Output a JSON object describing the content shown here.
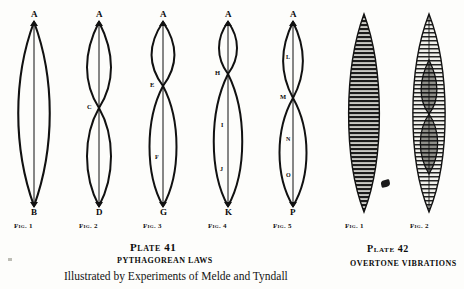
{
  "plate41": {
    "title": "Plate 41",
    "subtitle": "PYTHAGOREAN LAWS",
    "credit": "Illustrated by Experiments of Melde and Tyndall",
    "figures": [
      {
        "caption": "Fig. 1",
        "top_label": "A",
        "bottom_label": "B",
        "loops": 1,
        "nodes": [],
        "loop_labels": []
      },
      {
        "caption": "Fig. 2",
        "top_label": "A",
        "bottom_label": "D",
        "loops": 2,
        "nodes": [
          "C"
        ],
        "loop_labels": []
      },
      {
        "caption": "Fig. 3",
        "top_label": "A",
        "bottom_label": "G",
        "loops": 2,
        "nodes": [
          "E"
        ],
        "loop_labels": [
          "F"
        ]
      },
      {
        "caption": "Fig. 4",
        "top_label": "A",
        "bottom_label": "K",
        "loops": 2,
        "nodes": [
          "H"
        ],
        "loop_labels": [
          "I",
          "J"
        ]
      },
      {
        "caption": "Fig. 5",
        "top_label": "A",
        "bottom_label": "P",
        "loops": 2,
        "nodes": [
          "M"
        ],
        "loop_labels": [
          "L",
          "N",
          "O"
        ]
      }
    ]
  },
  "plate42": {
    "title": "Plate 42",
    "subtitle": "OVERTONE VIBRATIONS",
    "figures": [
      {
        "caption": "Fig. 1",
        "pattern": "fundamental-spindle"
      },
      {
        "caption": "Fig. 2",
        "pattern": "overtone-spindle"
      }
    ]
  }
}
